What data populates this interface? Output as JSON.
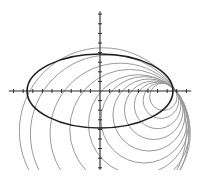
{
  "figure": {
    "colors": {
      "ellipse": "#1e1e1e",
      "circles": "#9a9a9a",
      "axes": "#2a2a2a",
      "background": "#ffffff"
    }
  },
  "axes": {
    "x_range": [
      -9.5,
      9.5
    ],
    "y_range": [
      -8.2,
      8.3
    ],
    "tick_step": 1
  },
  "ellipse": {
    "center": [
      0,
      0
    ],
    "semi_major": 7.6,
    "semi_minor": 3.85
  },
  "circle_family": {
    "common_point": [
      7.9,
      0
    ],
    "circles": [
      {
        "center": [
          0.3,
          -4.2
        ],
        "radius": 8.7
      },
      {
        "center": [
          1.0,
          -4.5
        ],
        "radius": 8.25
      },
      {
        "center": [
          2.1,
          -4.4
        ],
        "radius": 7.3
      },
      {
        "center": [
          3.1,
          -4.0
        ],
        "radius": 6.25
      },
      {
        "center": [
          4.0,
          -3.5
        ],
        "radius": 5.2
      },
      {
        "center": [
          4.6,
          -3.0
        ],
        "radius": 4.5
      },
      {
        "center": [
          5.1,
          -2.5
        ],
        "radius": 3.75
      },
      {
        "center": [
          5.6,
          -2.0
        ],
        "radius": 3.05
      },
      {
        "center": [
          6.0,
          -1.5
        ],
        "radius": 2.42
      },
      {
        "center": [
          6.35,
          -1.0
        ],
        "radius": 1.85
      },
      {
        "center": [
          6.6,
          -0.6
        ],
        "radius": 1.43
      }
    ]
  }
}
